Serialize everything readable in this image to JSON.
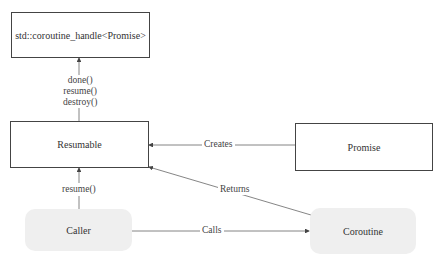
{
  "nodes": {
    "handle": {
      "label": "std::coroutine_handle<Promise>",
      "shape": "rectangle"
    },
    "resumable": {
      "label": "Resumable",
      "shape": "rectangle"
    },
    "promise": {
      "label": "Promise",
      "shape": "rectangle"
    },
    "caller": {
      "label": "Caller",
      "shape": "rounded-rectangle"
    },
    "coroutine": {
      "label": "Coroutine",
      "shape": "rounded-rectangle"
    }
  },
  "edges": {
    "resumable_to_handle": {
      "from": "Resumable",
      "to": "std::coroutine_handle<Promise>",
      "labels": [
        "done()",
        "resume()",
        "destroy()"
      ]
    },
    "promise_to_resumable": {
      "from": "Promise",
      "to": "Resumable",
      "label": "Creates"
    },
    "coroutine_to_resumable": {
      "from": "Coroutine",
      "to": "Resumable",
      "label": "Returns"
    },
    "caller_to_resumable": {
      "from": "Caller",
      "to": "Resumable",
      "label": "resume()"
    },
    "caller_to_coroutine": {
      "from": "Caller",
      "to": "Coroutine",
      "label": "Calls"
    }
  },
  "colors": {
    "stroke": "#444444",
    "rounded_fill": "#efefef"
  }
}
